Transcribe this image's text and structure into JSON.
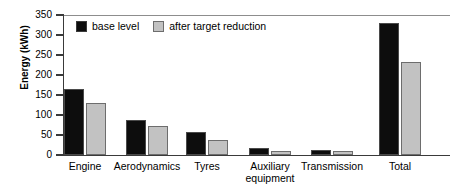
{
  "chart_data": {
    "type": "bar",
    "title": "",
    "xlabel": "",
    "ylabel": "Energy (kWh)",
    "ylim": [
      0,
      350
    ],
    "yticks": [
      0,
      50,
      100,
      150,
      200,
      250,
      300,
      350
    ],
    "ytick_labels": [
      "0",
      "50",
      "100",
      "150",
      "200",
      "250",
      "300",
      "350"
    ],
    "grid": "top-line-only",
    "legend_position": "upper-left-inside",
    "categories": [
      "Engine",
      "Aerodynamics",
      "Tyres",
      "Auxiliary\nequipment",
      "Transmission",
      "Total"
    ],
    "series": [
      {
        "name": "base level",
        "color": "#0d0d0d",
        "values": [
          164,
          88,
          57,
          17,
          12,
          330
        ]
      },
      {
        "name": "after target reduction",
        "color": "#c2c2c2",
        "values": [
          130,
          73,
          38,
          10,
          9,
          233
        ]
      }
    ]
  },
  "legend": {
    "items": [
      {
        "label": "base level",
        "swatch": "black-square-swatch"
      },
      {
        "label": "after target reduction",
        "swatch": "gray-square-swatch"
      }
    ]
  },
  "axes": {
    "y_title": "Energy (kWh)"
  }
}
